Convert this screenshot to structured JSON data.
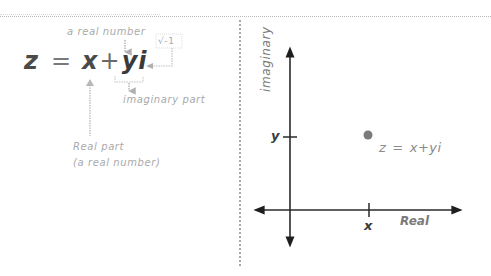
{
  "diagram": {
    "left_panel": {
      "formula": {
        "z": "z",
        "equals": "=",
        "x": "x",
        "plus": "+",
        "yi": "yi"
      },
      "annotations": {
        "y_note": "a real number",
        "i_note": "√-1",
        "imaginary_part": "imaginary part",
        "real_part": "Real part",
        "real_part_note": "(a real number)"
      }
    },
    "right_panel": {
      "axes": {
        "x_axis_label": "Real",
        "y_axis_label": "imaginary"
      },
      "ticks": {
        "x_tick": "x",
        "y_tick": "y"
      },
      "point": {
        "label_lhs": "z",
        "label_eq": "=",
        "label_rhs": "x+yi",
        "color": "#7a7a7a"
      }
    },
    "colors": {
      "text_dark": "#3a3a3a",
      "annotation_gray": "#a9a9a9",
      "axis": "#2a2a2a",
      "divider": "#a8a8a8"
    }
  }
}
